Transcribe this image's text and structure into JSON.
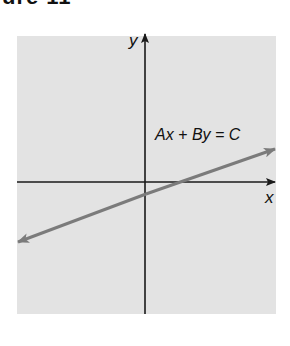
{
  "heading": {
    "text": "ure 11"
  },
  "figure": {
    "equation_label": "Ax + By = C",
    "x_axis_label": "x",
    "y_axis_label": "y",
    "colors": {
      "background_panel": "#e3e3e3",
      "axes": "#1a1a1a",
      "line": "#7b7b7b"
    }
  }
}
